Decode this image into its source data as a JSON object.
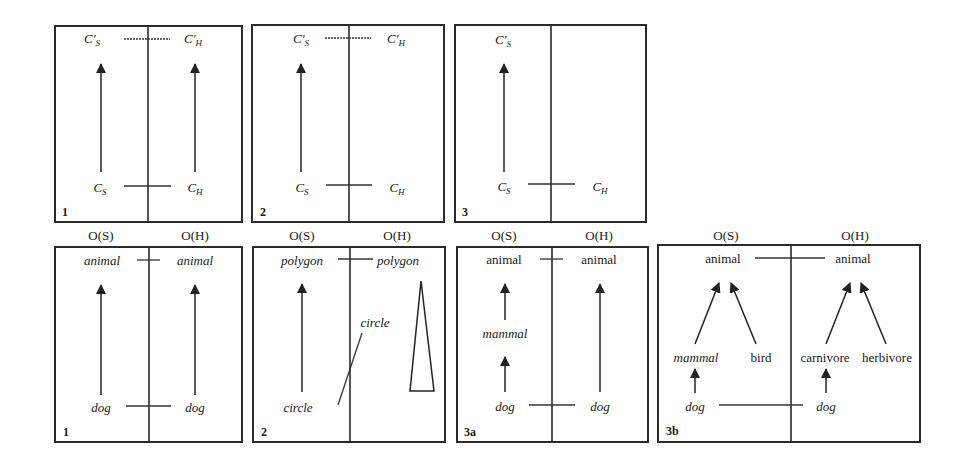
{
  "top_row": {
    "panels": [
      {
        "number": "1",
        "left_top": {
          "base": "C",
          "prime": "′",
          "sub": "S"
        },
        "right_top": {
          "base": "C",
          "prime": "′",
          "sub": "H"
        },
        "left_bottom": {
          "base": "C",
          "sub": "S"
        },
        "right_bottom": {
          "base": "C",
          "sub": "H"
        }
      },
      {
        "number": "2",
        "left_top": {
          "base": "C",
          "prime": "′",
          "sub": "S"
        },
        "right_top": {
          "base": "C",
          "prime": "′",
          "sub": "H"
        },
        "left_bottom": {
          "base": "C",
          "sub": "S"
        },
        "right_bottom": {
          "base": "C",
          "sub": "H"
        }
      },
      {
        "number": "3",
        "left_top": {
          "base": "C",
          "prime": "′",
          "sub": "S"
        },
        "left_bottom": {
          "base": "C",
          "sub": "S"
        },
        "right_bottom": {
          "base": "C",
          "sub": "H"
        }
      }
    ]
  },
  "bottom_row": {
    "panels": [
      {
        "number": "1",
        "header_left": "O(S)",
        "header_right": "O(H)",
        "left_top": "animal",
        "right_top": "animal",
        "left_bottom": "dog",
        "right_bottom": "dog"
      },
      {
        "number": "2",
        "header_left": "O(S)",
        "header_right": "O(H)",
        "left_top": "polygon",
        "right_top": "polygon",
        "left_bottom": "circle",
        "right_mid": "circle"
      },
      {
        "number": "3a",
        "header_left": "O(S)",
        "header_right": "O(H)",
        "left_top": "animal",
        "right_top": "animal",
        "left_mid": "mammal",
        "left_bottom": "dog",
        "right_bottom": "dog"
      },
      {
        "number": "3b",
        "header_left": "O(S)",
        "header_right": "O(H)",
        "left_top": "animal",
        "right_top": "animal",
        "left_mid_a": "mammal",
        "left_mid_b": "bird",
        "right_mid_a": "carnivore",
        "right_mid_b": "herbivore",
        "left_bottom": "dog",
        "right_bottom": "dog"
      }
    ]
  }
}
